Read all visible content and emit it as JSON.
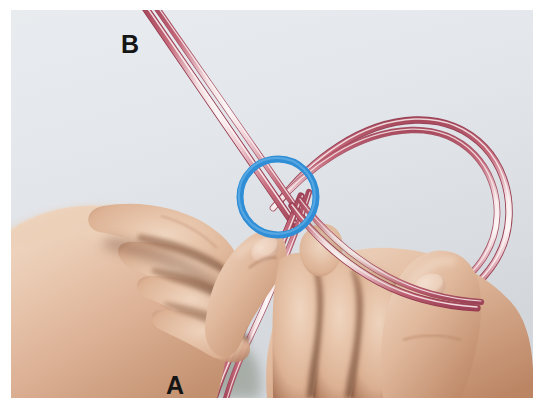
{
  "image": {
    "kind": "instructional-photograph",
    "subject": "two hands holding a translucent pink cord formed into a loop with a crossing point",
    "width": 544,
    "height": 410,
    "page_margin_color": "#ffffff",
    "background_color": "#e3e6ea",
    "background_color_2": "#d6dade"
  },
  "annotations": {
    "label_b": "B",
    "label_a": "A",
    "label_color": "#151515",
    "label_outline_color": "#fdfdfa",
    "highlight_circle": {
      "name": "crossing-point-highlight",
      "shape": "circle",
      "color": "#2f8ed6",
      "center_x": 278,
      "center_y": 197,
      "radius": 38,
      "stroke_width": 7
    }
  },
  "cord": {
    "color_edge": "#b44c60",
    "color_mid": "#e09aa8",
    "color_highlight": "#fdf2f3",
    "material": "translucent pink tubing",
    "strand_count": 2
  },
  "hands": {
    "skin_light": "#efd3bd",
    "skin_mid": "#ddb195",
    "skin_shadow": "#a9765a",
    "skin_deep_shadow": "#7e4f38",
    "nail_color": "#e5c3ae",
    "left_hand": "left hand, fingers curled, thumb raised toward the crossing",
    "right_hand": "right hand, thumb and fingers pinching the cord below the crossing"
  }
}
